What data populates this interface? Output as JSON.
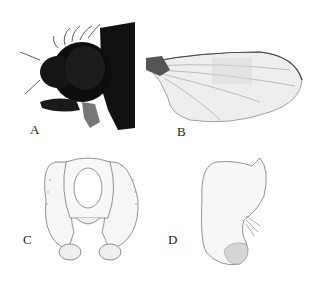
{
  "figure": {
    "panels": [
      {
        "id": "A",
        "label": "A",
        "content": "fly head lateral photograph"
      },
      {
        "id": "B",
        "label": "B",
        "content": "wing"
      },
      {
        "id": "C",
        "label": "C",
        "content": "male genitalia, posterior view"
      },
      {
        "id": "D",
        "label": "D",
        "content": "male genitalia, lateral view"
      }
    ]
  }
}
